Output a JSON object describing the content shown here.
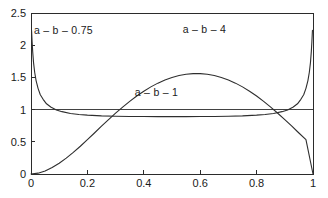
{
  "chart_data": {
    "type": "line",
    "title": "",
    "subtitle": "",
    "xlabel": "",
    "ylabel": "",
    "xlim": [
      0,
      1
    ],
    "ylim": [
      0,
      2.5
    ],
    "grid": false,
    "legend_position": "inline-annotations",
    "xticks": [
      "0",
      "0.2",
      "0.4",
      "0.6",
      "0.8",
      "1"
    ],
    "xtick_values": [
      0,
      0.2,
      0.4,
      0.6,
      0.8,
      1
    ],
    "yticks": [
      "0",
      "0.5",
      "1",
      "1.5",
      "2",
      "2.5"
    ],
    "ytick_values": [
      0,
      0.5,
      1,
      1.5,
      2,
      2.5
    ],
    "annotations": [
      {
        "text": "a – b – 0.75",
        "x": 0.115,
        "y": 2.18
      },
      {
        "text": "a – b – 4",
        "x": 0.615,
        "y": 2.19
      },
      {
        "text": "a – b – 1",
        "x": 0.445,
        "y": 1.21
      }
    ],
    "series": [
      {
        "name": "a – b – 0.75",
        "x": [
          0.002,
          0.004,
          0.006,
          0.009,
          0.013,
          0.018,
          0.025,
          0.033,
          0.043,
          0.055,
          0.07,
          0.09,
          0.11,
          0.14,
          0.17,
          0.2,
          0.25,
          0.3,
          0.35,
          0.4,
          0.45,
          0.5,
          0.55,
          0.6,
          0.65,
          0.7,
          0.75,
          0.8,
          0.83,
          0.86,
          0.89,
          0.91,
          0.93,
          0.945,
          0.957,
          0.967,
          0.975,
          0.982,
          0.987,
          0.991,
          0.994,
          0.996,
          0.998
        ],
        "values": [
          2.23,
          2.05,
          1.9,
          1.73,
          1.58,
          1.45,
          1.33,
          1.23,
          1.16,
          1.09,
          1.04,
          0.995,
          0.968,
          0.94,
          0.924,
          0.914,
          0.903,
          0.897,
          0.894,
          0.892,
          0.8915,
          0.8912,
          0.8915,
          0.892,
          0.894,
          0.897,
          0.903,
          0.914,
          0.924,
          0.94,
          0.968,
          0.995,
          1.04,
          1.09,
          1.16,
          1.23,
          1.33,
          1.45,
          1.58,
          1.73,
          1.9,
          2.05,
          2.23
        ]
      },
      {
        "name": "a – b – 1",
        "x": [
          0,
          1
        ],
        "values": [
          1,
          1
        ]
      },
      {
        "name": "a – b – 4",
        "x": [
          0,
          0.025,
          0.05,
          0.075,
          0.1,
          0.125,
          0.15,
          0.175,
          0.2,
          0.225,
          0.25,
          0.275,
          0.3,
          0.325,
          0.35,
          0.375,
          0.4,
          0.425,
          0.45,
          0.475,
          0.5,
          0.525,
          0.55,
          0.575,
          0.6,
          0.625,
          0.65,
          0.675,
          0.7,
          0.725,
          0.75,
          0.775,
          0.8,
          0.825,
          0.85,
          0.875,
          0.9,
          0.925,
          0.95,
          0.975,
          1
        ],
        "values": [
          0,
          0.013,
          0.048,
          0.1,
          0.167,
          0.246,
          0.335,
          0.431,
          0.533,
          0.637,
          0.742,
          0.845,
          0.944,
          1.039,
          1.128,
          1.211,
          1.286,
          1.353,
          1.411,
          1.46,
          1.499,
          1.529,
          1.549,
          1.559,
          1.559,
          1.549,
          1.529,
          1.499,
          1.46,
          1.411,
          1.353,
          1.286,
          1.211,
          1.128,
          1.039,
          0.944,
          0.845,
          0.742,
          0.637,
          0.533,
          0
        ]
      }
    ]
  },
  "figure": {
    "background_color": "#ffffff",
    "axis_color": "#2b2b2b",
    "curve_color": "#2e2e2e"
  }
}
